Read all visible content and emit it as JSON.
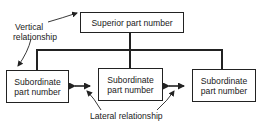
{
  "diagram": {
    "type": "hierarchy",
    "superior": {
      "label": "Superior part number"
    },
    "subordinates": [
      {
        "line1": "Subordinate",
        "line2": "part number"
      },
      {
        "line1": "Subordinate",
        "line2": "part number"
      },
      {
        "line1": "Subordinate",
        "line2": "part number"
      }
    ],
    "annotations": {
      "vertical_line1": "Vertical",
      "vertical_line2": "relationship",
      "lateral": "Lateral relationship"
    },
    "colors": {
      "line": "#222222",
      "background": "#ffffff",
      "text": "#1a1a1a"
    }
  }
}
